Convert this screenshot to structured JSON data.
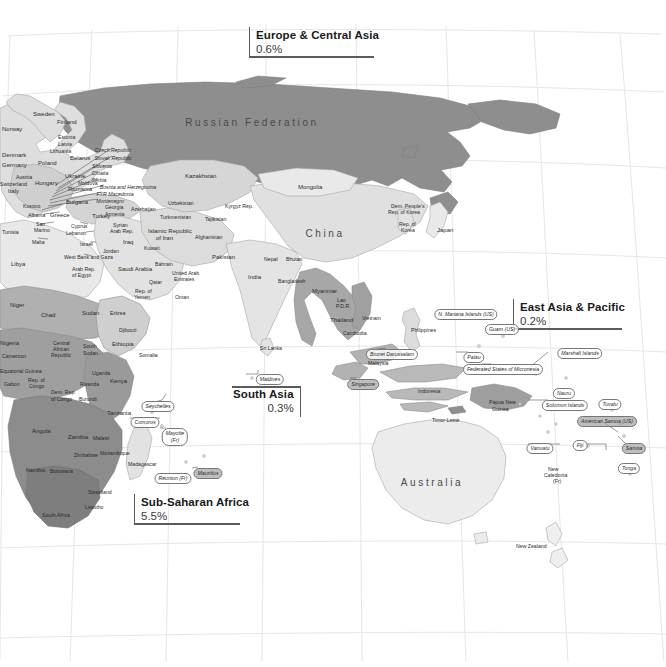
{
  "map": {
    "title": "World regional map",
    "projection_background": "#ffffff",
    "colors": {
      "darkest": "#8d8d8d",
      "dark": "#9a9a9a",
      "mid": "#b4b4b4",
      "light": "#d8d8d8",
      "lightest": "#efefef",
      "ocean": "#ffffff",
      "border": "#9b9b9b",
      "graticule": "#e2e2e2",
      "label_text": "#2b2b2b",
      "callout_rule": "#5b5b5b"
    }
  },
  "callouts": [
    {
      "id": "europe-central-asia",
      "title": "Europe & Central Asia",
      "value": "0.6%"
    },
    {
      "id": "east-asia-pacific",
      "title": "East Asia & Pacific",
      "value": "0.2%"
    },
    {
      "id": "south-asia",
      "title": "South Asia",
      "value": "0.3%"
    },
    {
      "id": "sub-saharan-africa",
      "title": "Sub-Saharan Africa",
      "value": "5.5%"
    }
  ],
  "region_labels": [
    {
      "name": "Russian Federation",
      "x": 252,
      "y": 122,
      "size": "big"
    },
    {
      "name": "China",
      "x": 325,
      "y": 233,
      "size": "big"
    },
    {
      "name": "Australia",
      "x": 432,
      "y": 482,
      "size": "big"
    }
  ],
  "country_labels": [
    {
      "name": "Norway",
      "x": 2,
      "y": 126,
      "s": "sz8"
    },
    {
      "name": "Sweden",
      "x": 33,
      "y": 111,
      "s": "sz8"
    },
    {
      "name": "Finland",
      "x": 57,
      "y": 119,
      "s": "sz8"
    },
    {
      "name": "Denmark",
      "x": 2,
      "y": 152,
      "s": "sz8"
    },
    {
      "name": "Estonia",
      "x": 58,
      "y": 134,
      "s": "sz7"
    },
    {
      "name": "Latvia",
      "x": 58,
      "y": 141,
      "s": "sz7"
    },
    {
      "name": "Lithuania",
      "x": 50,
      "y": 148,
      "s": "sz7"
    },
    {
      "name": "Poland",
      "x": 38,
      "y": 160,
      "s": "sz8"
    },
    {
      "name": "Belarus",
      "x": 70,
      "y": 155,
      "s": "sz8"
    },
    {
      "name": "Germany",
      "x": 2,
      "y": 162,
      "s": "sz8"
    },
    {
      "name": "Ukraine",
      "x": 65,
      "y": 173,
      "s": "sz8"
    },
    {
      "name": "Moldova",
      "x": 78,
      "y": 180,
      "s": "sz7"
    },
    {
      "name": "Romania",
      "x": 68,
      "y": 186,
      "s": "sz8"
    },
    {
      "name": "Hungary",
      "x": 35,
      "y": 180,
      "s": "sz8"
    },
    {
      "name": "Austria",
      "x": 16,
      "y": 174,
      "s": "sz7"
    },
    {
      "name": "Switzerland",
      "x": 0,
      "y": 181,
      "s": "sz7"
    },
    {
      "name": "Italy",
      "x": 8,
      "y": 188,
      "s": "sz8"
    },
    {
      "name": "Bulgaria",
      "x": 66,
      "y": 199,
      "s": "sz8"
    },
    {
      "name": "Kosovo",
      "x": 23,
      "y": 203,
      "s": "sz7"
    },
    {
      "name": "Albania",
      "x": 28,
      "y": 212,
      "s": "sz7"
    },
    {
      "name": "Greece",
      "x": 50,
      "y": 212,
      "s": "sz8"
    },
    {
      "name": "San",
      "x": 36,
      "y": 221,
      "s": "sz7"
    },
    {
      "name": "Marino",
      "x": 34,
      "y": 227,
      "s": "sz7"
    },
    {
      "name": "Malta",
      "x": 32,
      "y": 239,
      "s": "sz7"
    },
    {
      "name": "Turkey",
      "x": 92,
      "y": 213,
      "s": "sz8"
    },
    {
      "name": "Cyprus",
      "x": 71,
      "y": 223,
      "s": "sz7"
    },
    {
      "name": "Lebanon",
      "x": 66,
      "y": 230,
      "s": "sz7"
    },
    {
      "name": "Israel",
      "x": 80,
      "y": 241,
      "s": "sz7"
    },
    {
      "name": "West Bank and Gaza",
      "x": 64,
      "y": 254,
      "s": "sz7"
    },
    {
      "name": "Tunisia",
      "x": 2,
      "y": 229,
      "s": "sz7"
    },
    {
      "name": "Libya",
      "x": 11,
      "y": 261,
      "s": "sz8"
    },
    {
      "name": "Arab Rep.",
      "x": 72,
      "y": 266,
      "s": "sz7"
    },
    {
      "name": "of Egypt",
      "x": 72,
      "y": 272,
      "s": "sz7"
    },
    {
      "name": "Syrian",
      "x": 113,
      "y": 222,
      "s": "sz7"
    },
    {
      "name": "Arab Rep.",
      "x": 110,
      "y": 228,
      "s": "sz7"
    },
    {
      "name": "Iraq",
      "x": 123,
      "y": 239,
      "s": "sz8"
    },
    {
      "name": "Jordan",
      "x": 103,
      "y": 248,
      "s": "sz7"
    },
    {
      "name": "Saudi Arabia",
      "x": 118,
      "y": 266,
      "s": "sz8"
    },
    {
      "name": "Kuwait",
      "x": 144,
      "y": 245,
      "s": "sz7"
    },
    {
      "name": "Bahrain",
      "x": 155,
      "y": 261,
      "s": "sz7"
    },
    {
      "name": "Qatar",
      "x": 149,
      "y": 279,
      "s": "sz7"
    },
    {
      "name": "United Arab",
      "x": 172,
      "y": 270,
      "s": "sz7"
    },
    {
      "name": "Emirates",
      "x": 174,
      "y": 276,
      "s": "sz7"
    },
    {
      "name": "Oman",
      "x": 175,
      "y": 294,
      "s": "sz7"
    },
    {
      "name": "Rep. of",
      "x": 135,
      "y": 288,
      "s": "sz7"
    },
    {
      "name": "Yemen",
      "x": 134,
      "y": 294,
      "s": "sz7"
    },
    {
      "name": "Georgia",
      "x": 105,
      "y": 204,
      "s": "sz7"
    },
    {
      "name": "Armenia",
      "x": 105,
      "y": 211,
      "s": "sz7"
    },
    {
      "name": "Azerbaijan",
      "x": 131,
      "y": 206,
      "s": "sz7"
    },
    {
      "name": "Islamic Republic",
      "x": 148,
      "y": 228,
      "s": "sz8"
    },
    {
      "name": "of Iran",
      "x": 156,
      "y": 235,
      "s": "sz8"
    },
    {
      "name": "Kazakhstan",
      "x": 185,
      "y": 173,
      "s": "sz8"
    },
    {
      "name": "Uzbekistan",
      "x": 168,
      "y": 200,
      "s": "sz7"
    },
    {
      "name": "Turkmenistan",
      "x": 160,
      "y": 214,
      "s": "sz7"
    },
    {
      "name": "Kyrgyz Rep.",
      "x": 225,
      "y": 203,
      "s": "sz7"
    },
    {
      "name": "Tajikistan",
      "x": 205,
      "y": 216,
      "s": "sz7"
    },
    {
      "name": "Afghanistan",
      "x": 195,
      "y": 234,
      "s": "sz7"
    },
    {
      "name": "Pakistan",
      "x": 212,
      "y": 254,
      "s": "sz8"
    },
    {
      "name": "India",
      "x": 248,
      "y": 274,
      "s": "sz8"
    },
    {
      "name": "Nepal",
      "x": 264,
      "y": 256,
      "s": "sz7"
    },
    {
      "name": "Bhutan",
      "x": 286,
      "y": 256,
      "s": "sz7"
    },
    {
      "name": "Bangladesh",
      "x": 278,
      "y": 278,
      "s": "sz7"
    },
    {
      "name": "Sri Lanka",
      "x": 260,
      "y": 345,
      "s": "sz7"
    },
    {
      "name": "Myanmar",
      "x": 312,
      "y": 288,
      "s": "sz8"
    },
    {
      "name": "Lao",
      "x": 337,
      "y": 297,
      "s": "sz7"
    },
    {
      "name": "P.D.R.",
      "x": 336,
      "y": 303,
      "s": "sz7"
    },
    {
      "name": "Thailand",
      "x": 330,
      "y": 317,
      "s": "sz8"
    },
    {
      "name": "Vietnam",
      "x": 362,
      "y": 315,
      "s": "sz7"
    },
    {
      "name": "Cambodia",
      "x": 343,
      "y": 330,
      "s": "sz7"
    },
    {
      "name": "Mongolia",
      "x": 298,
      "y": 184,
      "s": "sz8"
    },
    {
      "name": "Dem. People's",
      "x": 391,
      "y": 203,
      "s": "sz7"
    },
    {
      "name": "Rep. of Korea",
      "x": 388,
      "y": 209,
      "s": "sz7"
    },
    {
      "name": "Rep. of",
      "x": 399,
      "y": 221,
      "s": "sz7"
    },
    {
      "name": "Korea",
      "x": 401,
      "y": 227,
      "s": "sz7"
    },
    {
      "name": "Japan",
      "x": 437,
      "y": 227,
      "s": "sz8"
    },
    {
      "name": "Philippines",
      "x": 411,
      "y": 327,
      "s": "sz7"
    },
    {
      "name": "Malaysia",
      "x": 368,
      "y": 360,
      "s": "sz7"
    },
    {
      "name": "Indonesia",
      "x": 418,
      "y": 388,
      "s": "sz7"
    },
    {
      "name": "Niger",
      "x": 10,
      "y": 302,
      "s": "sz8"
    },
    {
      "name": "Chad",
      "x": 41,
      "y": 312,
      "s": "sz8"
    },
    {
      "name": "Sudan",
      "x": 82,
      "y": 310,
      "s": "sz8"
    },
    {
      "name": "Eritrea",
      "x": 110,
      "y": 310,
      "s": "sz7"
    },
    {
      "name": "Djibouti",
      "x": 119,
      "y": 327,
      "s": "sz7"
    },
    {
      "name": "Ethiopia",
      "x": 112,
      "y": 341,
      "s": "sz8"
    },
    {
      "name": "Somalia",
      "x": 139,
      "y": 352,
      "s": "sz7"
    },
    {
      "name": "Nigeria",
      "x": 0,
      "y": 340,
      "s": "sz8"
    },
    {
      "name": "Cameroon",
      "x": 2,
      "y": 353,
      "s": "sz7"
    },
    {
      "name": "Central",
      "x": 53,
      "y": 340,
      "s": "sz7"
    },
    {
      "name": "African",
      "x": 53,
      "y": 346,
      "s": "sz7"
    },
    {
      "name": "Republic",
      "x": 51,
      "y": 352,
      "s": "sz7"
    },
    {
      "name": "South",
      "x": 83,
      "y": 343,
      "s": "sz7"
    },
    {
      "name": "Sudan",
      "x": 83,
      "y": 350,
      "s": "sz7"
    },
    {
      "name": "Equatorial Guinea",
      "x": 0,
      "y": 368,
      "s": "sz7"
    },
    {
      "name": "Gabon",
      "x": 4,
      "y": 381,
      "s": "sz7"
    },
    {
      "name": "Rep. of",
      "x": 28,
      "y": 377,
      "s": "sz7"
    },
    {
      "name": "Congo",
      "x": 29,
      "y": 383,
      "s": "sz7"
    },
    {
      "name": "Dem. Rep.",
      "x": 51,
      "y": 389,
      "s": "sz7"
    },
    {
      "name": "of Congo",
      "x": 51,
      "y": 396,
      "s": "sz7"
    },
    {
      "name": "Uganda",
      "x": 92,
      "y": 370,
      "s": "sz7"
    },
    {
      "name": "Rwanda",
      "x": 80,
      "y": 381,
      "s": "sz7"
    },
    {
      "name": "Burundi",
      "x": 79,
      "y": 396,
      "s": "sz7"
    },
    {
      "name": "Kenya",
      "x": 110,
      "y": 378,
      "s": "sz8"
    },
    {
      "name": "Tanzania",
      "x": 107,
      "y": 410,
      "s": "sz8"
    },
    {
      "name": "Angola",
      "x": 32,
      "y": 428,
      "s": "sz8"
    },
    {
      "name": "Zambia",
      "x": 68,
      "y": 434,
      "s": "sz8"
    },
    {
      "name": "Malawi",
      "x": 93,
      "y": 435,
      "s": "sz7"
    },
    {
      "name": "Zimbabwe",
      "x": 74,
      "y": 452,
      "s": "sz7"
    },
    {
      "name": "Mozambique",
      "x": 100,
      "y": 450,
      "s": "sz7"
    },
    {
      "name": "Namibia",
      "x": 26,
      "y": 467,
      "s": "sz7"
    },
    {
      "name": "Botswana",
      "x": 50,
      "y": 468,
      "s": "sz7"
    },
    {
      "name": "Swaziland",
      "x": 88,
      "y": 489,
      "s": "sz7"
    },
    {
      "name": "Lesotho",
      "x": 85,
      "y": 504,
      "s": "sz7"
    },
    {
      "name": "South Africa",
      "x": 42,
      "y": 512,
      "s": "sz7"
    },
    {
      "name": "Madagascar",
      "x": 128,
      "y": 461,
      "s": "sz7"
    },
    {
      "name": "Timor-Leste",
      "x": 432,
      "y": 417,
      "s": "sz7"
    },
    {
      "name": "Papua New",
      "x": 489,
      "y": 399,
      "s": "sz7"
    },
    {
      "name": "Guinea",
      "x": 492,
      "y": 406,
      "s": "sz7"
    },
    {
      "name": "New",
      "x": 548,
      "y": 466,
      "s": "sz7"
    },
    {
      "name": "Caledonia",
      "x": 544,
      "y": 472,
      "s": "sz7"
    },
    {
      "name": "(Fr)",
      "x": 553,
      "y": 478,
      "s": "sz7"
    },
    {
      "name": "New Zealand",
      "x": 516,
      "y": 543,
      "s": "sz7"
    }
  ],
  "island_labels": [
    {
      "name": "Maldives",
      "x": 270,
      "y": 374,
      "gray": false
    },
    {
      "name": "Seychelles",
      "x": 158,
      "y": 401,
      "gray": false
    },
    {
      "name": "Comoros",
      "x": 145,
      "y": 417,
      "gray": false
    },
    {
      "name": "Mayotte\n(Fr)",
      "x": 175,
      "y": 428,
      "gray": false
    },
    {
      "name": "Réunion (Fr)",
      "x": 173,
      "y": 473,
      "gray": false
    },
    {
      "name": "Mauritius",
      "x": 208,
      "y": 468,
      "gray": true
    },
    {
      "name": "Brunei Darussalam",
      "x": 392,
      "y": 349,
      "gray": false
    },
    {
      "name": "Singapore",
      "x": 363,
      "y": 379,
      "gray": true
    },
    {
      "name": "Palau",
      "x": 474,
      "y": 352,
      "gray": false
    },
    {
      "name": "Guam (US)",
      "x": 502,
      "y": 324,
      "gray": false
    },
    {
      "name": "N. Mariana Islands (US)",
      "x": 466,
      "y": 309,
      "gray": false
    },
    {
      "name": "Federated States of Micronesia",
      "x": 503,
      "y": 364,
      "gray": false
    },
    {
      "name": "Marshall Islands",
      "x": 580,
      "y": 348,
      "gray": false
    },
    {
      "name": "Nauru",
      "x": 564,
      "y": 388,
      "gray": false
    },
    {
      "name": "Solomon Islands",
      "x": 565,
      "y": 400,
      "gray": false
    },
    {
      "name": "Tuvalu",
      "x": 610,
      "y": 399,
      "gray": false
    },
    {
      "name": "American Samoa (US)",
      "x": 607,
      "y": 416,
      "gray": true
    },
    {
      "name": "Vanuatu",
      "x": 540,
      "y": 443,
      "gray": false
    },
    {
      "name": "Fiji",
      "x": 580,
      "y": 440,
      "gray": false
    },
    {
      "name": "Samoa",
      "x": 634,
      "y": 443,
      "gray": true
    },
    {
      "name": "Tonga",
      "x": 629,
      "y": 463,
      "gray": false
    },
    {
      "name": "Czech Republic",
      "x": 113,
      "y": 147,
      "gray": false,
      "plain": true
    },
    {
      "name": "Slovak Republic",
      "x": 113,
      "y": 155,
      "gray": false,
      "plain": true
    },
    {
      "name": "Slovenia",
      "x": 102,
      "y": 163,
      "gray": false,
      "plain": true
    },
    {
      "name": "Croatia",
      "x": 100,
      "y": 170,
      "gray": false,
      "plain": true
    },
    {
      "name": "Serbia",
      "x": 99,
      "y": 177,
      "gray": false,
      "plain": true
    },
    {
      "name": "Bosnia and Herzegovina",
      "x": 128,
      "y": 184,
      "gray": false,
      "plain": true
    },
    {
      "name": "FYR Macedonia",
      "x": 115,
      "y": 191,
      "gray": false,
      "plain": true
    },
    {
      "name": "Montenegro",
      "x": 110,
      "y": 198,
      "gray": false,
      "plain": true
    }
  ]
}
